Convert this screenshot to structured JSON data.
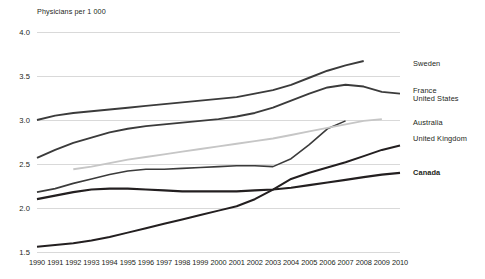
{
  "chart_data": {
    "type": "line",
    "title": "Physicians per 1 000",
    "xlabel": "",
    "ylabel": "Physicians per 1 000",
    "ylim": [
      1.5,
      4.0
    ],
    "yticks": [
      1.5,
      2.0,
      2.5,
      3.0,
      3.5,
      4.0
    ],
    "ytick_labels": [
      "1.5",
      "2.0",
      "2.5",
      "3.0",
      "3.5",
      "4.0"
    ],
    "xlim": [
      1990,
      2010
    ],
    "x": [
      1990,
      1991,
      1992,
      1993,
      1994,
      1995,
      1996,
      1997,
      1998,
      1999,
      2000,
      2001,
      2002,
      2003,
      2004,
      2005,
      2006,
      2007,
      2008,
      2009,
      2010
    ],
    "xtick_labels": [
      "1990",
      "1991",
      "1992",
      "1993",
      "1994",
      "1995",
      "1996",
      "1997",
      "1998",
      "1999",
      "2000",
      "2001",
      "2002",
      "2003",
      "2004",
      "2005",
      "2006",
      "2007",
      "2008",
      "2009",
      "2010"
    ],
    "grid": true,
    "legend_position": "right",
    "series": [
      {
        "name": "Sweden",
        "color": "#3b3b3b",
        "width": 1.9,
        "x": [
          1990,
          1991,
          1992,
          1993,
          1994,
          1995,
          1996,
          1997,
          1998,
          1999,
          2000,
          2001,
          2002,
          2003,
          2004,
          2005,
          2006,
          2007,
          2008
        ],
        "values": [
          3.0,
          3.05,
          3.08,
          3.1,
          3.12,
          3.14,
          3.16,
          3.18,
          3.2,
          3.22,
          3.24,
          3.26,
          3.3,
          3.34,
          3.4,
          3.48,
          3.56,
          3.62,
          3.67
        ]
      },
      {
        "name": "France",
        "color": "#3b3b3b",
        "width": 1.9,
        "x": [
          1990,
          1991,
          1992,
          1993,
          1994,
          1995,
          1996,
          1997,
          1998,
          1999,
          2000,
          2001,
          2002,
          2003,
          2004,
          2005,
          2006,
          2007,
          2008,
          2009,
          2010
        ],
        "values": [
          2.57,
          2.66,
          2.74,
          2.8,
          2.86,
          2.9,
          2.93,
          2.95,
          2.97,
          2.99,
          3.01,
          3.04,
          3.08,
          3.14,
          3.22,
          3.3,
          3.37,
          3.4,
          3.38,
          3.32,
          3.3
        ]
      },
      {
        "name": "United States",
        "color": "#3b3b3b",
        "width": 1.6,
        "x": [
          1990,
          1991,
          1992,
          1993,
          1994,
          1995,
          1996,
          1997,
          1998,
          1999,
          2000,
          2001,
          2002,
          2003,
          2004,
          2005,
          2006,
          2007
        ],
        "values": [
          2.18,
          2.22,
          2.28,
          2.33,
          2.38,
          2.42,
          2.44,
          2.44,
          2.45,
          2.46,
          2.47,
          2.48,
          2.48,
          2.47,
          2.56,
          2.72,
          2.9,
          2.99
        ]
      },
      {
        "name": "Australia",
        "color": "#c6c6c6",
        "width": 1.9,
        "x": [
          1992,
          1993,
          1994,
          1995,
          1996,
          1997,
          1998,
          1999,
          2000,
          2001,
          2002,
          2003,
          2004,
          2005,
          2006,
          2007,
          2008,
          2009
        ],
        "values": [
          2.44,
          2.47,
          2.51,
          2.55,
          2.58,
          2.61,
          2.64,
          2.67,
          2.7,
          2.73,
          2.76,
          2.79,
          2.83,
          2.87,
          2.91,
          2.95,
          2.99,
          3.01
        ]
      },
      {
        "name": "United Kingdom",
        "color": "#231f20",
        "width": 2.0,
        "x": [
          1990,
          1991,
          1992,
          1993,
          1994,
          1995,
          1996,
          1997,
          1998,
          1999,
          2000,
          2001,
          2002,
          2003,
          2004,
          2005,
          2006,
          2007,
          2008,
          2009,
          2010
        ],
        "values": [
          1.56,
          1.58,
          1.6,
          1.63,
          1.67,
          1.72,
          1.77,
          1.82,
          1.87,
          1.92,
          1.97,
          2.02,
          2.1,
          2.21,
          2.33,
          2.4,
          2.46,
          2.52,
          2.59,
          2.66,
          2.71
        ]
      },
      {
        "name": "Canada",
        "color": "#231f20",
        "width": 2.2,
        "x": [
          1990,
          1991,
          1992,
          1993,
          1994,
          1995,
          1996,
          1997,
          1998,
          1999,
          2000,
          2001,
          2002,
          2003,
          2004,
          2005,
          2006,
          2007,
          2008,
          2009,
          2010
        ],
        "values": [
          2.1,
          2.14,
          2.18,
          2.21,
          2.22,
          2.22,
          2.21,
          2.2,
          2.19,
          2.19,
          2.19,
          2.19,
          2.2,
          2.21,
          2.23,
          2.26,
          2.29,
          2.32,
          2.35,
          2.38,
          2.4
        ]
      }
    ]
  },
  "legend": [
    {
      "label": "Sweden",
      "bold": false
    },
    {
      "label": "France",
      "bold": false
    },
    {
      "label": "United States",
      "bold": false
    },
    {
      "label": "Australia",
      "bold": false
    },
    {
      "label": "United Kingdom",
      "bold": false
    },
    {
      "label": "Canada",
      "bold": true
    }
  ]
}
